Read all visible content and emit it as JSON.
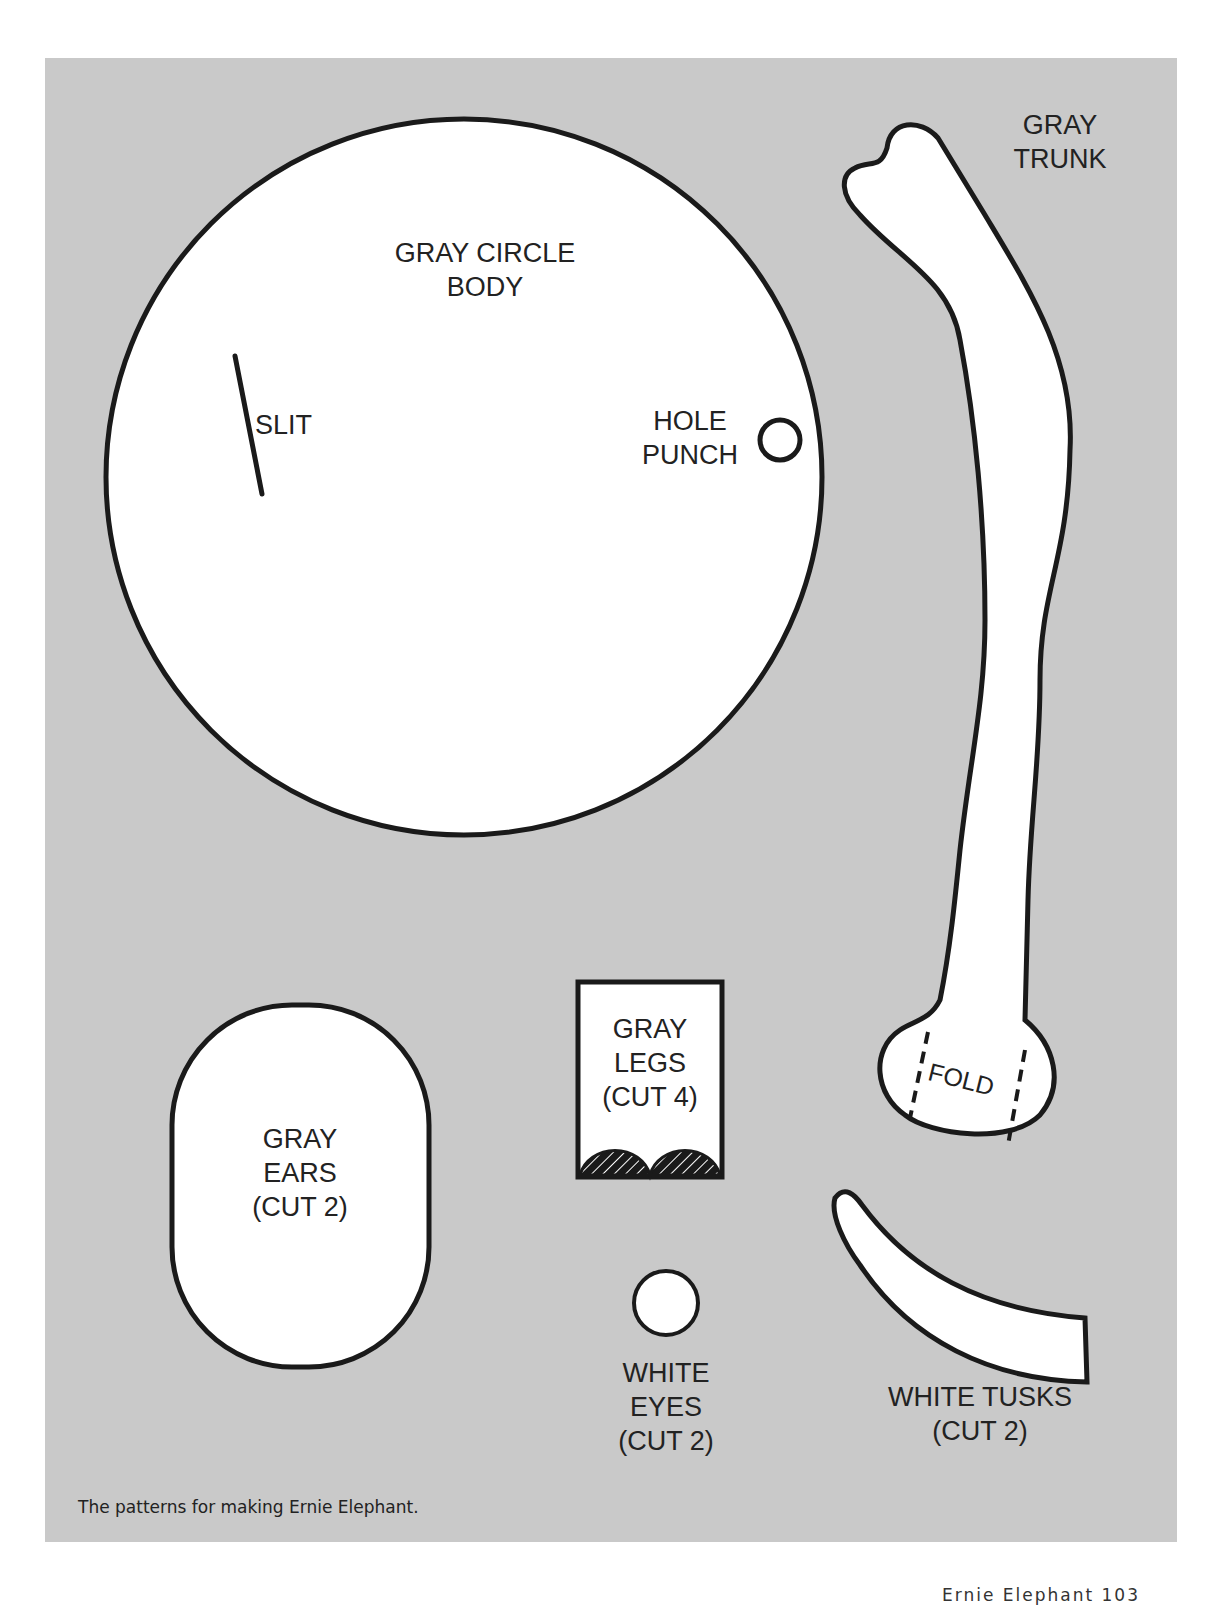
{
  "page": {
    "caption": "The patterns for making Ernie Elephant.",
    "footer": "Ernie Elephant   103"
  },
  "pieces": {
    "body": {
      "label": "GRAY CIRCLE\nBODY",
      "slit_label": "SLIT",
      "hole_label": "HOLE\nPUNCH"
    },
    "trunk": {
      "label": "GRAY\nTRUNK",
      "fold_label": "FOLD"
    },
    "ears": {
      "label": "GRAY\nEARS\n(CUT 2)"
    },
    "legs": {
      "label": "GRAY\nLEGS\n(CUT 4)"
    },
    "eyes": {
      "label": "WHITE\nEYES\n(CUT 2)"
    },
    "tusks": {
      "label": "WHITE TUSKS\n(CUT 2)"
    }
  },
  "colors": {
    "panel": "#c9c9c9",
    "piece_fill": "#ffffff",
    "outline": "#1a1a1a"
  }
}
